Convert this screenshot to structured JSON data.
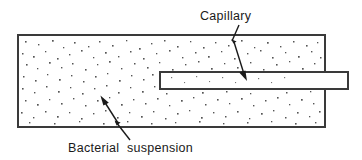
{
  "figure": {
    "background_color": "#ffffff",
    "line_color": "#3a3a3a",
    "fill_color": "#ffffff",
    "dot_color": "#555555",
    "text_color": "#1a1a1a"
  },
  "labels": {
    "capillary": "Capillary",
    "bacterial_suspension": "Bacterial  suspension"
  },
  "shapes": {
    "chamber": {
      "name": "bacterial-suspension-chamber",
      "x": 18,
      "y": 35,
      "width": 307,
      "height": 92
    },
    "capillary": {
      "name": "capillary-tube",
      "x": 160,
      "y": 72,
      "width": 188,
      "height": 17
    }
  },
  "annotations": {
    "capillary_leader": {
      "from_x": 240,
      "from_y": 26,
      "to_x": 247,
      "to_y": 80
    },
    "suspension_leader": {
      "from_x": 128,
      "from_y": 143,
      "to_x": 101,
      "to_y": 96
    }
  }
}
